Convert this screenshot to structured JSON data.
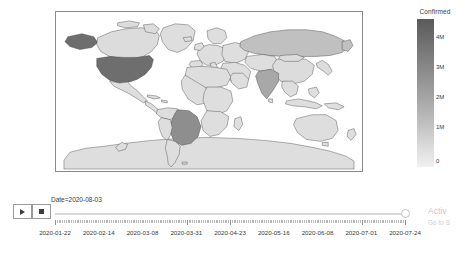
{
  "chart_data": {
    "type": "choropleth",
    "title": "",
    "colorbar_title": "Confirmed",
    "colorbar_ticks": [
      "4M",
      "3M",
      "2M",
      "1M",
      "0"
    ],
    "colorbar_range": [
      0,
      4500000
    ],
    "colorscale": "gray-reversed",
    "current_frame": "2020-08-03",
    "projection": "equirectangular",
    "legend_position": "right",
    "grid": false,
    "xlabel": "",
    "ylabel": "",
    "slider_prefix": "Date=",
    "slider_value": "2020-08-03",
    "slider_tick_labels": [
      "2020-01-22",
      "2020-02-14",
      "2020-03-08",
      "2020-03-31",
      "2020-04-23",
      "2020-05-16",
      "2020-06-08",
      "2020-07-01",
      "2020-07-24"
    ],
    "locations": [
      {
        "name": "United States",
        "value": 4600000,
        "shade": "#6e6e6e"
      },
      {
        "name": "Brazil",
        "value": 2750000,
        "shade": "#8e8e8e"
      },
      {
        "name": "India",
        "value": 1800000,
        "shade": "#a8a8a8"
      },
      {
        "name": "Russia",
        "value": 860000,
        "shade": "#c0c0c0"
      },
      {
        "name": "Canada",
        "value": 118000,
        "shade": "#dcdcdc"
      },
      {
        "name": "China",
        "value": 88000,
        "shade": "#dcdcdc"
      },
      {
        "name": "Rest of World",
        "value": 0,
        "shade": "#dedede"
      }
    ]
  },
  "controls": {
    "play_label": "Play",
    "pause_label": "Pause",
    "slider_label": "Date=2020-08-03"
  },
  "watermark": {
    "line1": "Activ",
    "line2": "Go to S"
  }
}
